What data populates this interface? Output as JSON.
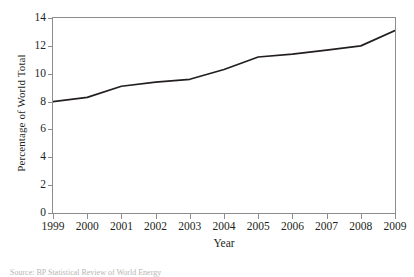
{
  "chart_data": {
    "type": "line",
    "title": "",
    "xlabel": "Year",
    "ylabel": "Percentage of World Total",
    "x": [
      1999,
      2000,
      2001,
      2002,
      2003,
      2004,
      2005,
      2006,
      2007,
      2008,
      2009
    ],
    "xtick_labels": [
      "1999",
      "2000",
      "2001",
      "2002",
      "2003",
      "2004",
      "2005",
      "2006",
      "2007",
      "2008",
      "2009"
    ],
    "values": [
      8.0,
      8.3,
      9.1,
      9.4,
      9.6,
      10.3,
      11.2,
      11.4,
      11.7,
      12.0,
      13.1
    ],
    "ytick_labels": [
      "0",
      "2",
      "4",
      "6",
      "8",
      "10",
      "12",
      "14"
    ],
    "yticks": [
      0,
      2,
      4,
      6,
      8,
      10,
      12,
      14
    ],
    "ylim": [
      0,
      14
    ],
    "xlim": [
      1999,
      2009
    ],
    "grid": false,
    "legend": false,
    "line_color": "#231f20",
    "axis_color": "#8d8d8d"
  },
  "figure": {
    "source_note": "Source:  BP Statistical Review of World Energy"
  }
}
